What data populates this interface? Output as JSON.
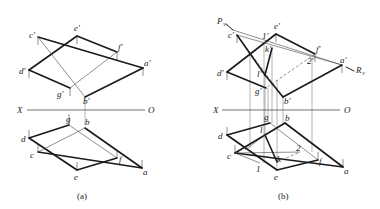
{
  "figure": {
    "panels": [
      {
        "id": "a",
        "caption": "(a)",
        "axis": {
          "x_label": "X",
          "o_label": "O"
        },
        "front_view_labels": {
          "c": "c'",
          "e": "e'",
          "f": "f'",
          "a": "a'",
          "d": "d'",
          "g": "g'",
          "b": "b'"
        },
        "top_view_labels": {
          "g": "g",
          "b": "b",
          "d": "d",
          "c": "c",
          "e": "e",
          "f": "f",
          "a": "a"
        }
      },
      {
        "id": "b",
        "caption": "(b)",
        "axis": {
          "x_label": "X",
          "o_label": "O"
        },
        "front_view_labels": {
          "P": "P",
          "P_sub": "V",
          "c": "c'",
          "one": "1'",
          "e": "e'",
          "k": "k'",
          "f": "f'",
          "two": "2'",
          "a": "a'",
          "R": "R",
          "R_sub": "V",
          "d": "d'",
          "l": "l'",
          "g": "g'",
          "b": "b'"
        },
        "top_view_labels": {
          "g": "g",
          "b": "b",
          "d": "d",
          "l": "l",
          "c": "c",
          "one": "1",
          "k": "k",
          "e": "e",
          "two": "2",
          "f": "f",
          "a": "a"
        }
      }
    ]
  }
}
